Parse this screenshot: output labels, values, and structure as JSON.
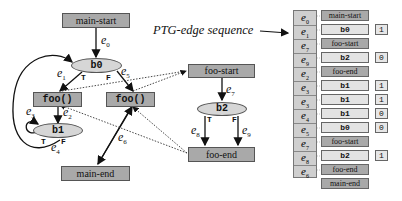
{
  "diagram": {
    "title": "PTG-edge sequence",
    "nodes": {
      "main_start": "main-start",
      "main_end": "main-end",
      "foo_call_1": "foo()",
      "foo_call_2": "foo()",
      "foo_start": "foo-start",
      "foo_end": "foo-end",
      "b0": "b0",
      "b1": "b1",
      "b2": "b2"
    },
    "edge_labels": {
      "e0": "e",
      "e0_sub": "0",
      "e1": "e",
      "e1_sub": "1",
      "e2": "e",
      "e2_sub": "2",
      "e3": "e",
      "e3_sub": "3",
      "e4": "e",
      "e4_sub": "4",
      "e5": "e",
      "e5_sub": "5",
      "e6": "e",
      "e6_sub": "6",
      "e7": "e",
      "e7_sub": "7",
      "e8": "e",
      "e8_sub": "8",
      "e9": "e",
      "e9_sub": "9"
    },
    "branch_labels": {
      "b0_true": "T",
      "b0_false": "F",
      "b1_true": "T",
      "b1_false": "F",
      "b2_true": "T",
      "b2_false": "F"
    },
    "sequence": {
      "edges": [
        {
          "e": "e",
          "sub": "0"
        },
        {
          "e": "e",
          "sub": "1"
        },
        {
          "e": "e",
          "sub": "7"
        },
        {
          "e": "e",
          "sub": "9"
        },
        {
          "e": "e",
          "sub": "2"
        },
        {
          "e": "e",
          "sub": "3"
        },
        {
          "e": "e",
          "sub": "3"
        },
        {
          "e": "e",
          "sub": "4"
        },
        {
          "e": "e",
          "sub": "5"
        },
        {
          "e": "e",
          "sub": "7"
        },
        {
          "e": "e",
          "sub": "8"
        },
        {
          "e": "e",
          "sub": "6"
        }
      ],
      "entries": [
        {
          "label": "main-start",
          "kind": "node",
          "value": ""
        },
        {
          "label": "b0",
          "kind": "branch",
          "value": "1"
        },
        {
          "label": "foo-start",
          "kind": "node",
          "value": ""
        },
        {
          "label": "b2",
          "kind": "branch",
          "value": "0"
        },
        {
          "label": "foo-end",
          "kind": "node",
          "value": ""
        },
        {
          "label": "b1",
          "kind": "branch",
          "value": "1"
        },
        {
          "label": "b1",
          "kind": "branch",
          "value": "1"
        },
        {
          "label": "b1",
          "kind": "branch",
          "value": "0"
        },
        {
          "label": "b0",
          "kind": "branch",
          "value": "0"
        },
        {
          "label": "foo-start",
          "kind": "node",
          "value": ""
        },
        {
          "label": "b2",
          "kind": "branch",
          "value": "1"
        },
        {
          "label": "foo-end",
          "kind": "node",
          "value": ""
        },
        {
          "label": "main-end",
          "kind": "node",
          "value": ""
        }
      ]
    }
  }
}
